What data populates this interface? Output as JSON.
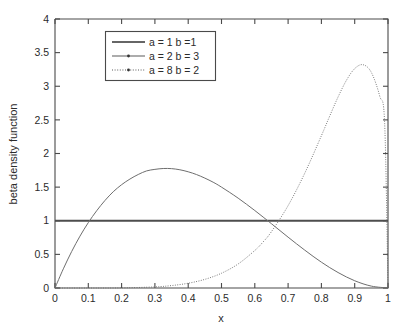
{
  "chart_data": {
    "type": "line",
    "title": "",
    "xlabel": "x",
    "ylabel": "beta density function",
    "xlim": [
      0,
      1
    ],
    "ylim": [
      0,
      4
    ],
    "grid": false,
    "legend_position": "upper-left-inside",
    "xticks": [
      "0",
      "0.1",
      "0.2",
      "0.3",
      "0.4",
      "0.5",
      "0.6",
      "0.7",
      "0.8",
      "0.9",
      "1"
    ],
    "xtick_values": [
      0,
      0.1,
      0.2,
      0.3,
      0.4,
      0.5,
      0.6,
      0.7,
      0.8,
      0.9,
      1
    ],
    "yticks": [
      "0",
      "0.5",
      "1",
      "1.5",
      "2",
      "2.5",
      "3",
      "3.5",
      "4"
    ],
    "ytick_values": [
      0,
      0.5,
      1,
      1.5,
      2,
      2.5,
      3,
      3.5,
      4
    ],
    "series": [
      {
        "name": "a = 1 b =1",
        "a": 1,
        "b": 1,
        "style": "solid",
        "marker": "none",
        "color": "#4d4d4d",
        "x": [
          0,
          0.05,
          0.1,
          0.15,
          0.2,
          0.25,
          0.3,
          0.35,
          0.4,
          0.45,
          0.5,
          0.55,
          0.6,
          0.65,
          0.7,
          0.75,
          0.8,
          0.85,
          0.9,
          0.95,
          1
        ],
        "values": [
          1,
          1,
          1,
          1,
          1,
          1,
          1,
          1,
          1,
          1,
          1,
          1,
          1,
          1,
          1,
          1,
          1,
          1,
          1,
          1,
          1
        ]
      },
      {
        "name": "a = 2 b = 3",
        "a": 2,
        "b": 3,
        "style": "solid",
        "marker": "dot",
        "color": "#6e6e6e",
        "peak_x": 0.3333,
        "peak_y": 1.7778,
        "x": [
          0,
          0.025,
          0.05,
          0.075,
          0.1,
          0.125,
          0.15,
          0.175,
          0.2,
          0.225,
          0.25,
          0.275,
          0.3,
          0.325,
          0.35,
          0.375,
          0.4,
          0.425,
          0.45,
          0.475,
          0.5,
          0.55,
          0.6,
          0.65,
          0.7,
          0.75,
          0.8,
          0.85,
          0.9,
          0.95,
          1
        ],
        "values": [
          0,
          0.285,
          0.542,
          0.771,
          0.972,
          1.148,
          1.301,
          1.432,
          1.536,
          1.62,
          1.688,
          1.741,
          1.764,
          1.777,
          1.775,
          1.758,
          1.728,
          1.687,
          1.634,
          1.573,
          1.5,
          1.336,
          1.152,
          0.956,
          0.756,
          0.563,
          0.384,
          0.23,
          0.108,
          0.028,
          0
        ]
      },
      {
        "name": "a = 8 b = 2",
        "a": 8,
        "b": 2,
        "style": "dashdot",
        "marker": "dot",
        "color": "#6e6e6e",
        "peak_x": 0.875,
        "peak_y": 3.52,
        "x": [
          0,
          0.1,
          0.2,
          0.3,
          0.35,
          0.4,
          0.45,
          0.5,
          0.55,
          0.6,
          0.625,
          0.65,
          0.7,
          0.75,
          0.8,
          0.825,
          0.85,
          0.875,
          0.9,
          0.925,
          0.95,
          0.975,
          0.99,
          1
        ],
        "values": [
          0,
          6.5e-06,
          0.0018,
          0.0164,
          0.0362,
          0.0708,
          0.1285,
          0.2197,
          0.3575,
          0.5578,
          0.6854,
          0.8381,
          1.2252,
          1.7071,
          2.2648,
          2.5575,
          2.8399,
          3.0871,
          3.2625,
          3.3201,
          3.2055,
          2.8551,
          2.4419,
          0
        ]
      }
    ]
  },
  "legend": {
    "entries": [
      {
        "label": "a = 1 b =1"
      },
      {
        "label": "a = 2 b = 3"
      },
      {
        "label": "a = 8 b = 2"
      }
    ]
  },
  "colors": {
    "background": "#ffffff",
    "axis": "#4a4a4a",
    "curve": "#6e6e6e",
    "curve_bold": "#4d4d4d",
    "text": "#2b2b2b"
  }
}
